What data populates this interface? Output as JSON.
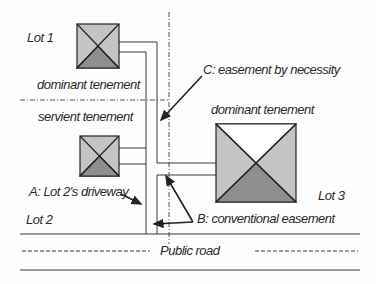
{
  "diagram": {
    "type": "easement-site-plan",
    "lots": [
      {
        "id": "lot1",
        "label": "Lot 1",
        "role": "dominant tenement"
      },
      {
        "id": "lot2",
        "label": "Lot 2",
        "role": "servient tenement"
      },
      {
        "id": "lot3",
        "label": "Lot 3",
        "role": "dominant tenement"
      }
    ],
    "labels": {
      "lot1": "Lot 1",
      "lot2": "Lot 2",
      "lot3": "Lot 3",
      "lot1_role": "dominant tenement",
      "lot2_role": "servient tenement",
      "lot3_role": "dominant tenement",
      "easement_a": "A: Lot 2's driveway",
      "easement_b": "B: conventional easement",
      "easement_c": "C: easement by necessity",
      "road": "Public road"
    },
    "colors": {
      "roof_light": "#c4c4c4",
      "roof_top": "#ffffff",
      "roof_dark": "#8e8e8e",
      "line": "#3a3a3a",
      "text": "#2a2a2a"
    }
  }
}
